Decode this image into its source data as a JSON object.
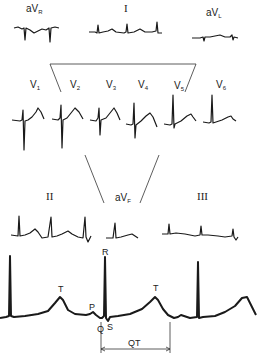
{
  "diagram": {
    "type": "ecg-12-lead-illustration",
    "limb_leads_top": [
      {
        "name": "aVR",
        "base": "aV",
        "sub": "R",
        "description": "inverted complexes"
      },
      {
        "name": "I",
        "base": "I",
        "sub": "",
        "description": "upright small complexes"
      },
      {
        "name": "aVL",
        "base": "aV",
        "sub": "L",
        "description": "low amplitude complexes"
      }
    ],
    "precordial_leads": [
      {
        "name": "V1",
        "base": "V",
        "sub": "1"
      },
      {
        "name": "V2",
        "base": "V",
        "sub": "2"
      },
      {
        "name": "V3",
        "base": "V",
        "sub": "3"
      },
      {
        "name": "V4",
        "base": "V",
        "sub": "4"
      },
      {
        "name": "V5",
        "base": "V",
        "sub": "5"
      },
      {
        "name": "V6",
        "base": "V",
        "sub": "6"
      }
    ],
    "inferior_leads": [
      {
        "name": "II",
        "base": "II",
        "sub": ""
      },
      {
        "name": "aVF",
        "base": "aV",
        "sub": "F"
      },
      {
        "name": "III",
        "base": "III",
        "sub": ""
      }
    ],
    "rhythm_strip": {
      "wave_labels": {
        "R": "R",
        "T1": "T",
        "P": "P",
        "Q": "Q",
        "S": "S",
        "T2": "T"
      },
      "interval_label": "QT"
    }
  }
}
